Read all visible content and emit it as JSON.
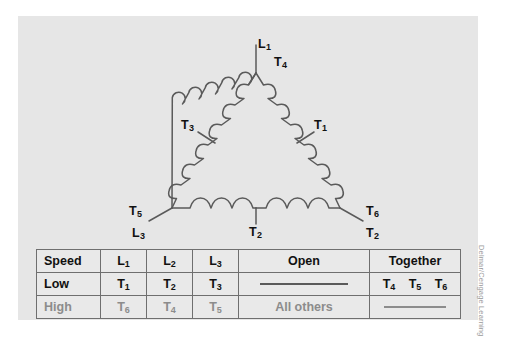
{
  "figure": {
    "panel_background": "#e6e6e6",
    "credit": "Delmar/Cengage Learning"
  },
  "diagram": {
    "type": "delta-connected two-speed motor winding",
    "line_color": "#5a5a5a",
    "labels": [
      {
        "id": "L1",
        "text": "L₁",
        "base": "L",
        "sub": "1",
        "x": 246,
        "y": 28
      },
      {
        "id": "T4",
        "text": "T₄",
        "base": "T",
        "sub": "4",
        "x": 260,
        "y": 44
      },
      {
        "id": "T3",
        "text": "T₃",
        "base": "T",
        "sub": "3",
        "x": 185,
        "y": 108
      },
      {
        "id": "T1",
        "text": "T₁",
        "base": "T",
        "sub": "1",
        "x": 308,
        "y": 108
      },
      {
        "id": "T5",
        "text": "T₅",
        "base": "T",
        "sub": "5",
        "x": 137,
        "y": 196
      },
      {
        "id": "L3",
        "text": "L₃",
        "base": "L",
        "sub": "3",
        "x": 140,
        "y": 222
      },
      {
        "id": "T6",
        "text": "T₆",
        "base": "T",
        "sub": "6",
        "x": 352,
        "y": 196
      },
      {
        "id": "L2",
        "text": "L₂",
        "base": "L",
        "sub": "2",
        "x": 352,
        "y": 222
      },
      {
        "id": "T2",
        "text": "T₂",
        "base": "T",
        "sub": "2",
        "x": 249,
        "y": 219
      }
    ]
  },
  "table": {
    "headers": [
      "Speed",
      "L₁",
      "L₂",
      "L₃",
      "Open",
      "Together"
    ],
    "rows": [
      {
        "name": "low",
        "style": "dark",
        "cells": [
          "Low",
          "T₁",
          "T₂",
          "T₃",
          "",
          ""
        ],
        "open_is_dash": true,
        "together_is_dash": false,
        "together_values": [
          "T₄",
          "T₅",
          "T₆"
        ]
      },
      {
        "name": "high",
        "style": "gray",
        "cells": [
          "High",
          "T₆",
          "T₄",
          "T₅",
          "All others",
          ""
        ],
        "open_is_dash": false,
        "together_is_dash": true,
        "together_values": []
      }
    ]
  }
}
